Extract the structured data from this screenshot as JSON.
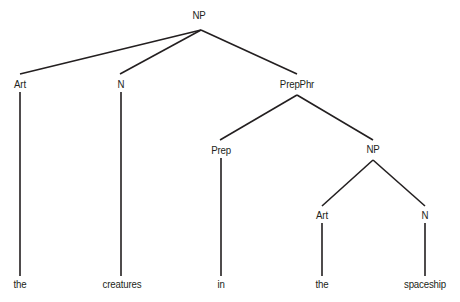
{
  "figure": {
    "kind": "constituency-syntax-tree",
    "sentence_fragment": "the creatures in the spaceship",
    "background_color": "#ffffff",
    "ink_color": "#231f20"
  },
  "nodes": [
    {
      "id": "np-root",
      "label": "NP",
      "x": 199,
      "y": 15,
      "apex_x": 201,
      "apex_y": 30
    },
    {
      "id": "art-1",
      "label": "Art",
      "x": 20,
      "y": 84,
      "apex_x": 20,
      "apex_y": 92
    },
    {
      "id": "n-1",
      "label": "N",
      "x": 121,
      "y": 84,
      "apex_x": 121,
      "apex_y": 92
    },
    {
      "id": "prepphr",
      "label": "PrepPhr",
      "x": 297,
      "y": 84,
      "apex_x": 297,
      "apex_y": 95
    },
    {
      "id": "prep",
      "label": "Prep",
      "x": 221,
      "y": 150,
      "apex_x": 221,
      "apex_y": 158
    },
    {
      "id": "np-inner",
      "label": "NP",
      "x": 373,
      "y": 149,
      "apex_x": 373,
      "apex_y": 160
    },
    {
      "id": "art-2",
      "label": "Art",
      "x": 322,
      "y": 215,
      "apex_x": 322,
      "apex_y": 223
    },
    {
      "id": "n-2",
      "label": "N",
      "x": 425,
      "y": 215,
      "apex_x": 425,
      "apex_y": 223
    }
  ],
  "leaves": [
    {
      "id": "leaf-the-1",
      "label": "the",
      "x": 20,
      "y": 284
    },
    {
      "id": "leaf-creatures",
      "label": "creatures",
      "x": 122,
      "y": 284
    },
    {
      "id": "leaf-in",
      "label": "in",
      "x": 221,
      "y": 284
    },
    {
      "id": "leaf-the-2",
      "label": "the",
      "x": 322,
      "y": 284
    },
    {
      "id": "leaf-spaceship",
      "label": "spaceship",
      "x": 425,
      "y": 284
    }
  ],
  "edges": [
    {
      "id": "edge-np-art1",
      "from": "np-root",
      "to": "art-1",
      "x1": 201,
      "y1": 30,
      "x2": 20,
      "y2": 74
    },
    {
      "id": "edge-np-n1",
      "from": "np-root",
      "to": "n-1",
      "x1": 201,
      "y1": 30,
      "x2": 120,
      "y2": 74
    },
    {
      "id": "edge-np-prepphr",
      "from": "np-root",
      "to": "prepphr",
      "x1": 201,
      "y1": 30,
      "x2": 297,
      "y2": 74
    },
    {
      "id": "edge-prepphr-prep",
      "from": "prepphr",
      "to": "prep",
      "x1": 297,
      "y1": 95,
      "x2": 220,
      "y2": 140
    },
    {
      "id": "edge-prepphr-np2",
      "from": "prepphr",
      "to": "np-inner",
      "x1": 297,
      "y1": 95,
      "x2": 373,
      "y2": 140
    },
    {
      "id": "edge-np2-art2",
      "from": "np-inner",
      "to": "art-2",
      "x1": 373,
      "y1": 160,
      "x2": 322,
      "y2": 206
    },
    {
      "id": "edge-np2-n2",
      "from": "np-inner",
      "to": "n-2",
      "x1": 373,
      "y1": 160,
      "x2": 425,
      "y2": 206
    }
  ],
  "stems": [
    {
      "id": "stem-art1-the",
      "from": "art-1",
      "to": "leaf-the-1",
      "x": 20,
      "y1": 92,
      "y2": 276
    },
    {
      "id": "stem-n1-creatures",
      "from": "n-1",
      "to": "leaf-creatures",
      "x": 121,
      "y1": 92,
      "y2": 276
    },
    {
      "id": "stem-prep-in",
      "from": "prep",
      "to": "leaf-in",
      "x": 221,
      "y1": 158,
      "y2": 276
    },
    {
      "id": "stem-art2-the",
      "from": "art-2",
      "to": "leaf-the-2",
      "x": 322,
      "y1": 223,
      "y2": 276
    },
    {
      "id": "stem-n2-spaceship",
      "from": "n-2",
      "to": "leaf-spaceship",
      "x": 425,
      "y1": 223,
      "y2": 276
    }
  ]
}
